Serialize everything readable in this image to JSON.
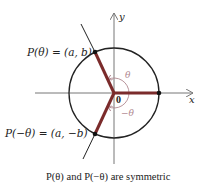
{
  "diagram": {
    "point_top_label": "P(θ) = (a, b)",
    "point_bottom_label": "P(−θ) = (a, −b)",
    "angle_top_label": "θ",
    "angle_bottom_label": "−θ",
    "origin_label": "0",
    "x_axis_label": "x",
    "y_axis_label": "y",
    "caption": "P(θ) and P(−θ) are symmetric",
    "colors": {
      "radius_segments": "#7b2b2b",
      "angle_arcs": "#b08890",
      "axes": "#777777",
      "circle": "#222222"
    },
    "geometry": {
      "center": [
        114,
        93
      ],
      "radius": 45,
      "theta_degrees": 115
    }
  }
}
